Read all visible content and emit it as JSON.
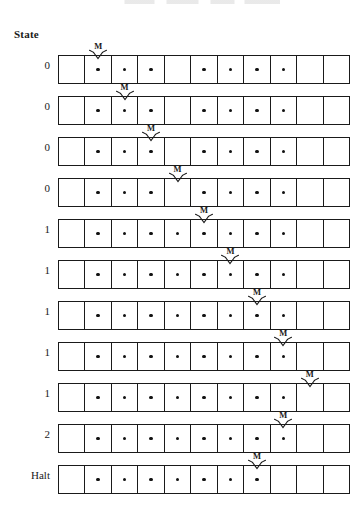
{
  "diagram": {
    "kind": "turing-machine-tape-trace",
    "column_header": "State",
    "head_marker_label": "M",
    "cells_per_row": 11,
    "mark_glyph": "dot",
    "rows": [
      {
        "state": "0",
        "head_cell": 2,
        "marks": [
          2,
          3,
          4,
          6,
          7,
          8,
          9
        ]
      },
      {
        "state": "0",
        "head_cell": 3,
        "marks": [
          2,
          3,
          4,
          6,
          7,
          8,
          9
        ]
      },
      {
        "state": "0",
        "head_cell": 4,
        "marks": [
          2,
          3,
          4,
          6,
          7,
          8,
          9
        ]
      },
      {
        "state": "0",
        "head_cell": 5,
        "marks": [
          2,
          3,
          4,
          6,
          7,
          8,
          9
        ]
      },
      {
        "state": "1",
        "head_cell": 6,
        "marks": [
          2,
          3,
          4,
          5,
          6,
          7,
          8,
          9
        ]
      },
      {
        "state": "1",
        "head_cell": 7,
        "marks": [
          2,
          3,
          4,
          5,
          6,
          7,
          8,
          9
        ]
      },
      {
        "state": "1",
        "head_cell": 8,
        "marks": [
          2,
          3,
          4,
          5,
          6,
          7,
          8,
          9
        ]
      },
      {
        "state": "1",
        "head_cell": 9,
        "marks": [
          2,
          3,
          4,
          5,
          6,
          7,
          8,
          9
        ]
      },
      {
        "state": "1",
        "head_cell": 10,
        "marks": [
          2,
          3,
          4,
          5,
          6,
          7,
          8,
          9
        ]
      },
      {
        "state": "2",
        "head_cell": 9,
        "marks": [
          2,
          3,
          4,
          5,
          6,
          7,
          8,
          9
        ]
      },
      {
        "state": "Halt",
        "head_cell": 8,
        "marks": [
          2,
          3,
          4,
          5,
          6,
          7,
          8
        ]
      }
    ]
  },
  "colors": {
    "ink": "#1a1a1a",
    "mark": "#111111",
    "paper": "#ffffff"
  },
  "layout": {
    "row_top_start": 44,
    "row_pitch": 41,
    "tape_left": 58,
    "tape_width": 292
  }
}
